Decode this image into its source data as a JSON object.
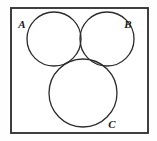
{
  "figure": {
    "kind": "venn-diagram",
    "set_count": 3
  },
  "frame": {
    "name": "universal-set-rectangle",
    "x": 11,
    "y": 8,
    "width": 137,
    "height": 125,
    "stroke": "#2b2b2b",
    "stroke_width": 1.8,
    "fill": "#ffffff"
  },
  "style": {
    "background": "#fefefe",
    "circle_stroke": "#2b2b2b",
    "circle_stroke_width": 1.3,
    "circle_fill": "none",
    "shade_fill": "#c9c9c9",
    "shade_stroke": "#2b2b2b",
    "label_color": "#1a1a1a"
  },
  "circles": [
    {
      "label": "A",
      "name": "circle-a",
      "cx": 54,
      "cy": 39,
      "r": 27,
      "label_x": 22,
      "label_y": 25
    },
    {
      "label": "B",
      "name": "circle-b",
      "cx": 107,
      "cy": 39,
      "r": 27,
      "label_x": 128,
      "label_y": 25
    },
    {
      "label": "C",
      "name": "circle-c",
      "cx": 83,
      "cy": 93,
      "r": 34,
      "label_x": 112,
      "label_y": 125
    }
  ],
  "shaded_region": {
    "name": "region-b-and-c-not-a",
    "expression": "(B ∩ C) − A",
    "fill": "#c9c9c9"
  }
}
